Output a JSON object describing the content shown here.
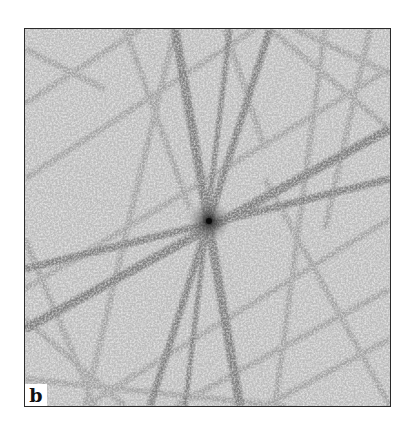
{
  "figure": {
    "panel_label": "b",
    "colors": {
      "background": "#ffffff",
      "pattern_base": "#bdbdbd",
      "band": "#8a8a8a",
      "center": "#111111",
      "frame": "#2a2a2a",
      "label_bg": "#ffffff"
    }
  }
}
